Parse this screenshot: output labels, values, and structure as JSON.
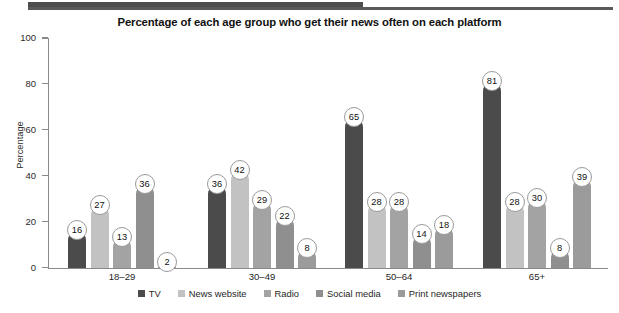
{
  "chart_data": {
    "type": "bar",
    "title": "Percentage of each age group who get their news often on each platform",
    "xlabel": "",
    "ylabel": "Percentage",
    "ylim": [
      0,
      100
    ],
    "yticks": [
      0,
      20,
      40,
      60,
      80,
      100
    ],
    "ytick_labels": [
      "0",
      "20",
      "40",
      "60",
      "80",
      "100"
    ],
    "grid": false,
    "legend_position": "bottom",
    "categories": [
      "18–29",
      "30–49",
      "50–64",
      "65+"
    ],
    "series": [
      {
        "name": "TV",
        "color": "#4b4b4b",
        "values": [
          16,
          36,
          65,
          81
        ]
      },
      {
        "name": "News website",
        "color": "#c2c2c2",
        "values": [
          27,
          42,
          28,
          28
        ]
      },
      {
        "name": "Radio",
        "color": "#a3a3a3",
        "values": [
          13,
          29,
          28,
          30
        ]
      },
      {
        "name": "Social media",
        "color": "#8f8f8f",
        "values": [
          36,
          22,
          14,
          8
        ]
      },
      {
        "name": "Print newspapers",
        "color": "#9b9b9b",
        "values": [
          2,
          8,
          18,
          39
        ]
      }
    ]
  },
  "decor": {
    "top_strip_color": "#4d6b6b"
  }
}
